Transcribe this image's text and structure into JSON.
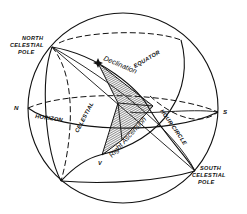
{
  "figure": {
    "type": "celestial-sphere-diagram",
    "labels": {
      "north_pole": [
        "NORTH",
        "CELESTIAL",
        "POLE"
      ],
      "south_pole": [
        "SOUTH",
        "CELESTIAL",
        "POLE"
      ],
      "north_point": "N",
      "south_point": "S",
      "equator": "EQUATOR",
      "horizon": "HORIZON",
      "celestial_meridian": "CELESTIAL",
      "hour_circle": "HOUR CIRCLE",
      "declination": "Declination",
      "right_ascension": "Right Ascension",
      "vernal_equinox": "V"
    },
    "colors": {
      "ink": "#111111",
      "background": "#ffffff",
      "hatch": "#555555"
    }
  }
}
